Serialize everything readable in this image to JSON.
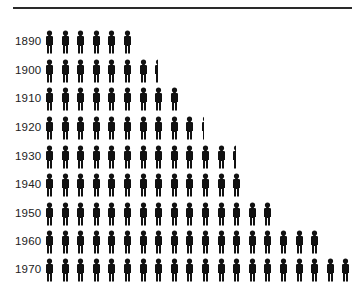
{
  "chart_data": {
    "type": "pictogram",
    "title": "",
    "xlabel": "",
    "ylabel": "",
    "icon": "person-icon",
    "categories": [
      "1890",
      "1900",
      "1910",
      "1920",
      "1930",
      "1940",
      "1950",
      "1960",
      "1970"
    ],
    "values": [
      6,
      7.4,
      9,
      10.3,
      12.4,
      13,
      15,
      18,
      20
    ],
    "grid": false,
    "legend": null,
    "top_rule": true,
    "color": "#111111"
  }
}
